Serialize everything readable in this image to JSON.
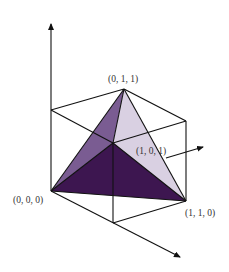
{
  "diagram": {
    "type": "3d-cube-tetrahedron",
    "labels": {
      "v011": "(0, 1, 1)",
      "v101": "(1, 0, 1)",
      "v000": "(0, 0, 0)",
      "v110": "(1, 1, 0)"
    },
    "colors": {
      "face_left": "#7a5c92",
      "face_right": "#d9d0e2",
      "face_bottom": "#3d1650",
      "edge": "#111111"
    },
    "axes": [
      "z-axis-up",
      "y-axis-right",
      "x-axis-down-right"
    ]
  }
}
